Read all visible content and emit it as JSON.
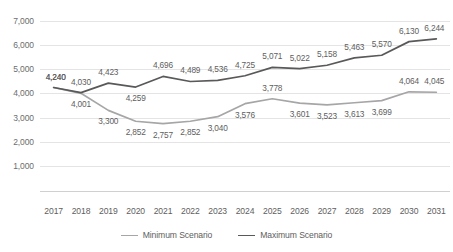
{
  "chart_data": {
    "type": "line",
    "title": "",
    "subtitle": "",
    "xlabel": "",
    "ylabel": "",
    "categories": [
      "2017",
      "2018",
      "2019",
      "2020",
      "2021",
      "2022",
      "2023",
      "2024",
      "2025",
      "2026",
      "2027",
      "2028",
      "2029",
      "2030",
      "2031"
    ],
    "series": [
      {
        "name": "Minimum Scenario",
        "color": "#a6a6a6",
        "values": [
          4240,
          4001,
          3300,
          2852,
          2757,
          2852,
          3040,
          3576,
          3778,
          3601,
          3523,
          3613,
          3699,
          4064,
          4045
        ],
        "labels": [
          "4,240",
          "4,001",
          "3,300",
          "2,852",
          "2,757",
          "2,852",
          "3,040",
          "3,576",
          "3,778",
          "3,601",
          "3,523",
          "3,613",
          "3,699",
          "4,064",
          "4,045"
        ],
        "label_offsets_px": [
          -11,
          11,
          11,
          11,
          11,
          11,
          11,
          11,
          -11,
          11,
          11,
          11,
          11,
          -11,
          -11
        ]
      },
      {
        "name": "Maximum Scenario",
        "color": "#595959",
        "values": [
          4240,
          4030,
          4423,
          4259,
          4696,
          4489,
          4536,
          4725,
          5071,
          5022,
          5158,
          5463,
          5570,
          6130,
          6244
        ],
        "labels": [
          "4,240",
          "4,030",
          "4,423",
          "4,259",
          "4,696",
          "4,489",
          "4,536",
          "4,725",
          "5,071",
          "5,022",
          "5,158",
          "5,463",
          "5,570",
          "6,130",
          "6,244"
        ],
        "label_offsets_px": [
          -11,
          -11,
          -11,
          11,
          -11,
          -11,
          -11,
          -11,
          -11,
          -11,
          -11,
          -11,
          -11,
          -11,
          -11
        ]
      }
    ],
    "ylim": [
      0,
      7000
    ],
    "yticks": [
      1000,
      2000,
      3000,
      4000,
      5000,
      6000,
      7000
    ],
    "ytick_labels": [
      "1,000",
      "2,000",
      "3,000",
      "4,000",
      "5,000",
      "6,000",
      "7,000"
    ],
    "grid": true,
    "legend_position": "bottom",
    "axis_line_color": "#d0d0d0",
    "grid_color": "#e4e4e4",
    "text_color": "#5e5e5e"
  }
}
